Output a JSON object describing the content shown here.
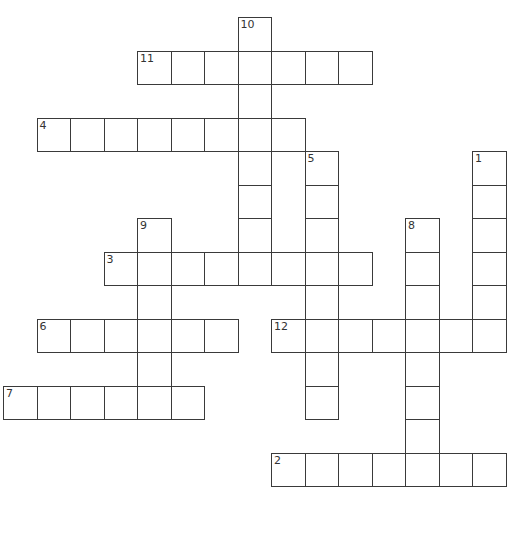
{
  "puzzle": {
    "type": "crossword",
    "cell_size": 33.5,
    "origin": {
      "x": 3,
      "y": 17
    },
    "entries": [
      {
        "number": "1",
        "direction": "down",
        "row": 4,
        "col": 14,
        "length": 6
      },
      {
        "number": "2",
        "direction": "across",
        "row": 13,
        "col": 8,
        "length": 7
      },
      {
        "number": "3",
        "direction": "across",
        "row": 7,
        "col": 3,
        "length": 8
      },
      {
        "number": "4",
        "direction": "across",
        "row": 3,
        "col": 1,
        "length": 8
      },
      {
        "number": "5",
        "direction": "down",
        "row": 4,
        "col": 9,
        "length": 8
      },
      {
        "number": "6",
        "direction": "across",
        "row": 9,
        "col": 1,
        "length": 6
      },
      {
        "number": "7",
        "direction": "across",
        "row": 11,
        "col": 0,
        "length": 6
      },
      {
        "number": "8",
        "direction": "down",
        "row": 6,
        "col": 12,
        "length": 8
      },
      {
        "number": "9",
        "direction": "down",
        "row": 6,
        "col": 4,
        "length": 6
      },
      {
        "number": "10",
        "direction": "down",
        "row": 0,
        "col": 7,
        "length": 8
      },
      {
        "number": "11",
        "direction": "across",
        "row": 1,
        "col": 4,
        "length": 7
      },
      {
        "number": "12",
        "direction": "across",
        "row": 9,
        "col": 8,
        "length": 7
      }
    ]
  }
}
